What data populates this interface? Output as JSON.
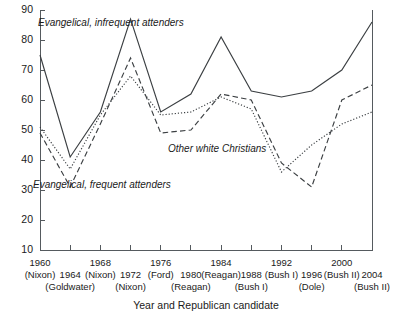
{
  "chart_data": {
    "type": "line",
    "title": "",
    "subtitle": "",
    "xlabel": "Year and Republican candidate",
    "ylabel": "",
    "xlim": [
      1960,
      2004
    ],
    "ylim": [
      10,
      90
    ],
    "grid": false,
    "legend_position": "inline-annotations",
    "categories": [
      "1960",
      "1964",
      "1968",
      "1972",
      "1976",
      "1980",
      "1984",
      "1988",
      "1992",
      "1996",
      "2000",
      "2004"
    ],
    "x_tick_candidates": [
      "(Nixon)",
      "(Goldwater)",
      "(Nixon)",
      "(Nixon)",
      "(Ford)",
      "(Reagan)",
      "(Reagan)",
      "(Bush I)",
      "(Bush I)",
      "(Dole)",
      "(Bush II)",
      "(Bush II)"
    ],
    "x_tick_rows": [
      {
        "row": "upper",
        "year": "1960",
        "candidate": "(Nixon)"
      },
      {
        "row": "lower",
        "year": "1964",
        "candidate": "(Goldwater)"
      },
      {
        "row": "upper",
        "year": "1968",
        "candidate": "(Nixon)"
      },
      {
        "row": "lower",
        "year": "1972",
        "candidate": "(Nixon)"
      },
      {
        "row": "upper",
        "year": "1976",
        "candidate": "(Ford)"
      },
      {
        "row": "lower",
        "year": "1980",
        "candidate": "(Reagan)"
      },
      {
        "row": "upper",
        "year": "1984",
        "candidate": "(Reagan)"
      },
      {
        "row": "lower",
        "year": "1988",
        "candidate": "(Bush I)"
      },
      {
        "row": "upper",
        "year": "1992",
        "candidate": "(Bush I)"
      },
      {
        "row": "lower",
        "year": "1996",
        "candidate": "(Dole)"
      },
      {
        "row": "upper",
        "year": "2000",
        "candidate": "(Bush II)"
      },
      {
        "row": "lower",
        "year": "2004",
        "candidate": "(Bush II)"
      }
    ],
    "y_ticks": [
      10,
      20,
      30,
      40,
      50,
      60,
      70,
      80,
      90
    ],
    "series": [
      {
        "name": "Evangelical, infrequent attenders",
        "style": "solid",
        "color": "#3b3f42",
        "values": [
          75,
          41,
          56,
          87,
          56,
          62,
          81,
          63,
          61,
          63,
          70,
          86
        ]
      },
      {
        "name": "Evangelical, frequent attenders",
        "style": "dashed",
        "color": "#3b3f42",
        "values": [
          49,
          31,
          52,
          74,
          49,
          50,
          62,
          60,
          39,
          31,
          60,
          65
        ]
      },
      {
        "name": "Other white Christians",
        "style": "dotted",
        "color": "#3b3f42",
        "values": [
          51,
          37,
          55,
          68,
          55,
          56,
          61,
          57,
          36,
          45,
          52,
          56
        ]
      }
    ],
    "annotations": [
      {
        "text": "Evangelical, infrequent attenders",
        "x_px": 38,
        "y_px": 26,
        "anchor": "start"
      },
      {
        "text": "Evangelical, frequent attenders",
        "x_px": 33,
        "y_px": 188,
        "anchor": "start"
      },
      {
        "text": "Other white Christians",
        "x_px": 168,
        "y_px": 152,
        "anchor": "start"
      }
    ],
    "axis_color": "#555a5e"
  }
}
